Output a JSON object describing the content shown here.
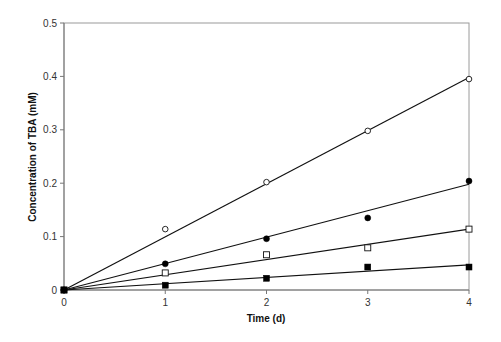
{
  "chart_data": {
    "type": "scatter",
    "title": "",
    "xlabel": "Time (d)",
    "ylabel": "Concentration of TBA (mM)",
    "xlim": [
      0,
      4
    ],
    "ylim": [
      0,
      0.5
    ],
    "x_ticks": [
      "0",
      "1",
      "2",
      "3",
      "4"
    ],
    "y_ticks": [
      "0",
      "0.1",
      "0.2",
      "0.3",
      "0.4",
      "0.5"
    ],
    "grid": false,
    "legend": null,
    "x": [
      0,
      1,
      2,
      3,
      4
    ],
    "series": [
      {
        "name": "open circles",
        "marker": "open-circle",
        "values": [
          0,
          0.114,
          0.202,
          0.298,
          0.395
        ],
        "fit_line": {
          "slope": 0.0995,
          "intercept": 0
        }
      },
      {
        "name": "filled circles",
        "marker": "filled-circle",
        "values": [
          0,
          0.049,
          0.096,
          0.135,
          0.204
        ],
        "fit_line": {
          "slope": 0.0495,
          "intercept": 0
        }
      },
      {
        "name": "open squares",
        "marker": "open-square",
        "values": [
          0,
          0.032,
          0.066,
          0.079,
          0.114
        ],
        "fit_line": {
          "slope": 0.0285,
          "intercept": 0
        }
      },
      {
        "name": "filled squares",
        "marker": "filled-square",
        "values": [
          0,
          0.009,
          0.022,
          0.043,
          0.043
        ],
        "fit_line": {
          "slope": 0.0118,
          "intercept": 0
        }
      }
    ]
  }
}
